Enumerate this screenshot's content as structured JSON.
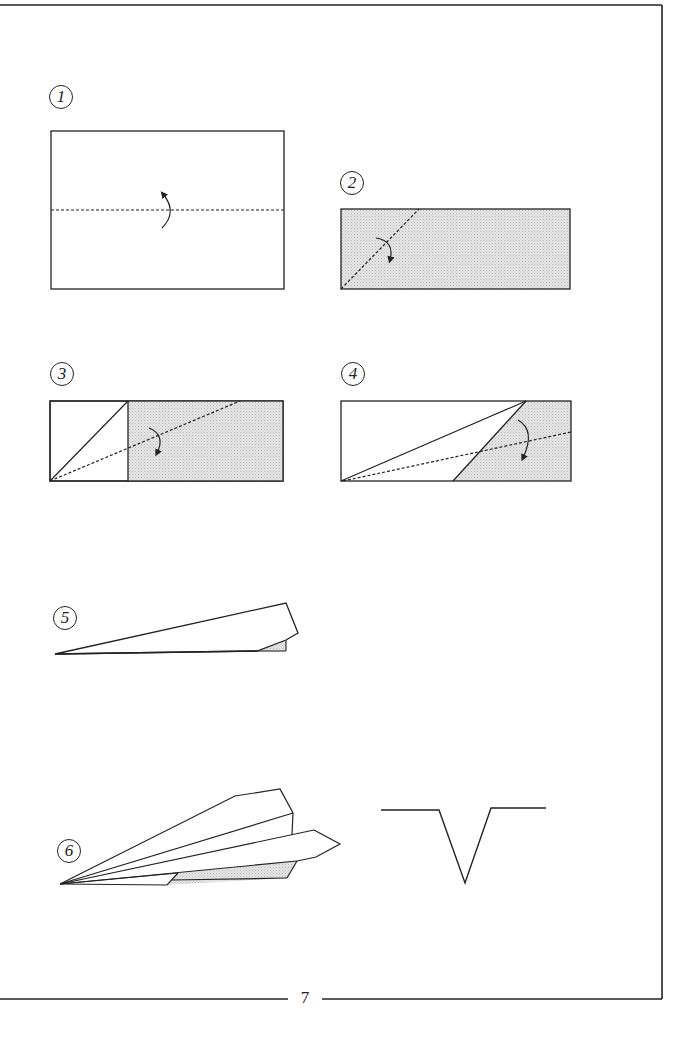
{
  "page": {
    "page_number": "7",
    "colors": {
      "line": "#222222",
      "shade": "#d9d9d9",
      "paper": "#ffffff"
    }
  },
  "steps": [
    {
      "number": "1",
      "description": "Rectangle with horizontal valley fold (dashed) and fold-over arrow"
    },
    {
      "number": "2",
      "description": "Folded strip (shaded) with diagonal dashed fold line from bottom-left and arrow"
    },
    {
      "number": "3",
      "description": "Strip with left corner folded as triangle; dashed fold line from bottom-left corner; arrow"
    },
    {
      "number": "4",
      "description": "Strip with long triangle fold; shaded remainder; dashed fold line; arrow"
    },
    {
      "number": "5",
      "description": "Folded wedge shape with small shaded corner"
    },
    {
      "number": "6",
      "description": "Completed paper airplane side view with shaded underside"
    }
  ],
  "front_view": {
    "description": "Front view of airplane: V-shaped fuselage with flat wings"
  }
}
